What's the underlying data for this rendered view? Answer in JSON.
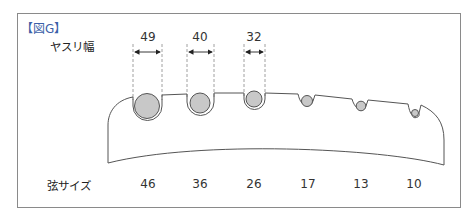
{
  "figure": {
    "label": "【図G】",
    "label_color": "#3b5fa8",
    "file_width_label": "ヤスリ幅",
    "string_size_label": "弦サイズ",
    "file_widths": [
      {
        "value": "49",
        "x": 148
      },
      {
        "value": "40",
        "x": 200
      },
      {
        "value": "32",
        "x": 254
      }
    ],
    "strings": [
      {
        "gauge": "46",
        "x": 148
      },
      {
        "gauge": "36",
        "x": 200
      },
      {
        "gauge": "26",
        "x": 254
      },
      {
        "gauge": "17",
        "x": 308
      },
      {
        "gauge": "13",
        "x": 361
      },
      {
        "gauge": "10",
        "x": 414
      }
    ],
    "colors": {
      "line": "#555555",
      "ball_fill": "#c8c8c8",
      "ball_stroke": "#555555",
      "frame": "#8a8a8a"
    }
  }
}
